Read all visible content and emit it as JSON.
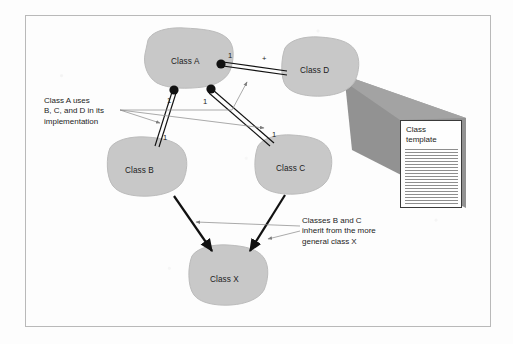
{
  "figure": {
    "kind": "class-relationship-diagram",
    "colors": {
      "blob_fill": "#c8c8c8",
      "blob_edge": "#bdbdbd",
      "link": "#111111",
      "leader": "#8d8d8d",
      "wedge": "#8a8a8a",
      "border": "#b9b9b9",
      "text": "#1c1c1c"
    }
  },
  "classes": [
    {
      "id": "a",
      "label": "Class A"
    },
    {
      "id": "d",
      "label": "Class D"
    },
    {
      "id": "b",
      "label": "Class B"
    },
    {
      "id": "c",
      "label": "Class C"
    },
    {
      "id": "x",
      "label": "Class X"
    }
  ],
  "multiplicities": {
    "a_to_d_near_a": "1",
    "a_to_d_near_d": "+",
    "a_to_b_near_a": "1",
    "a_to_b_near_b": "1",
    "a_to_c_near_a": "1",
    "a_to_c_near_c": "1"
  },
  "annotations": {
    "uses": "Class A uses\nB, C, and D in its\nimplementation",
    "inherits": "Classes B and C\ninherit from the more\ngeneral class X"
  },
  "template": {
    "title": "Class\ntemplate",
    "rule_count": 19
  }
}
